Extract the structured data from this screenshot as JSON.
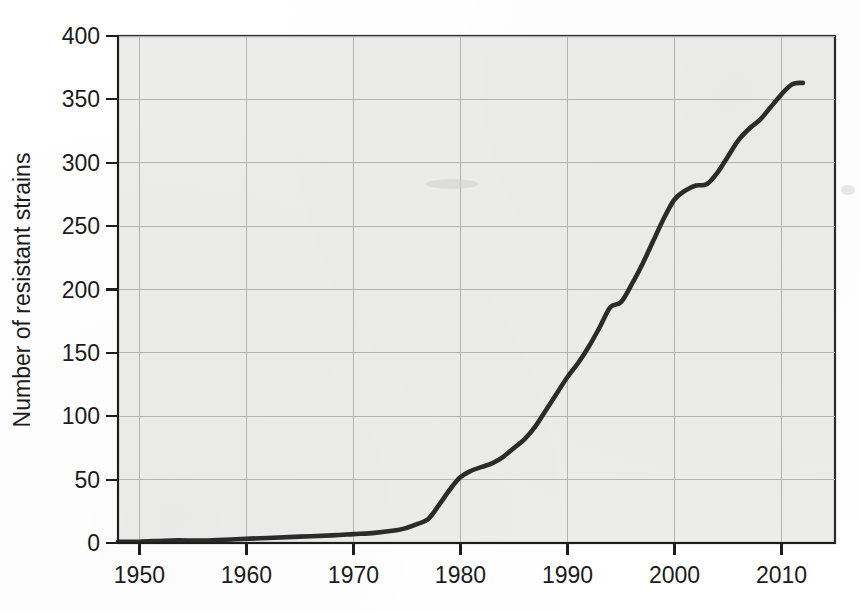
{
  "chart_data": {
    "type": "line",
    "title": "",
    "xlabel": "",
    "ylabel": "Number of resistant strains",
    "xlim": [
      1948,
      2015
    ],
    "ylim": [
      0,
      400
    ],
    "grid": true,
    "legend": "none",
    "line_color": "#2b2b2b",
    "plot_background": "#ececeb",
    "gridline_color": "#b4b4b4",
    "xticks": [
      1950,
      1960,
      1970,
      1980,
      1990,
      2000,
      2010
    ],
    "xtick_labels": [
      "1950",
      "1960",
      "1970",
      "1980",
      "1990",
      "2000",
      "2010"
    ],
    "yticks": [
      0,
      50,
      100,
      150,
      200,
      250,
      300,
      350,
      400
    ],
    "ytick_labels": [
      "0",
      "50",
      "100",
      "150",
      "200",
      "250",
      "300",
      "350",
      "400"
    ],
    "series": [
      {
        "name": "Number of resistant strains",
        "x": [
          1948,
          1950,
          1953,
          1956,
          1959,
          1962,
          1965,
          1968,
          1970,
          1972,
          1974,
          1975,
          1976,
          1977,
          1978,
          1979,
          1980,
          1981,
          1982,
          1983,
          1984,
          1985,
          1986,
          1987,
          1988,
          1989,
          1990,
          1991,
          1992,
          1993,
          1994,
          1995,
          1996,
          1997,
          1998,
          1999,
          2000,
          2001,
          2002,
          2003,
          2004,
          2005,
          2006,
          2007,
          2008,
          2009,
          2010,
          2011,
          2012
        ],
        "y": [
          1,
          1,
          2,
          2,
          3,
          4,
          5,
          6,
          7,
          8,
          10,
          12,
          15,
          19,
          30,
          42,
          52,
          57,
          60,
          63,
          68,
          75,
          82,
          92,
          105,
          118,
          131,
          142,
          155,
          170,
          186,
          190,
          204,
          220,
          238,
          256,
          271,
          278,
          282,
          283,
          292,
          305,
          318,
          327,
          334,
          344,
          354,
          362,
          363
        ]
      }
    ]
  },
  "axes": {
    "y_title": "Number of resistant strains"
  }
}
